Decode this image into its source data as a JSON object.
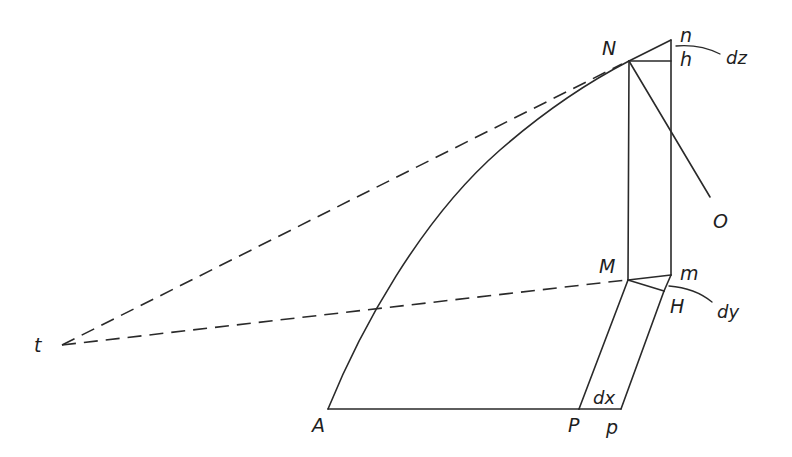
{
  "diagram": {
    "type": "geometric-construction",
    "stroke_color": "#2a2a2a",
    "label_color": "#1e1e1e",
    "points": {
      "t": {
        "label": "t",
        "x": 62,
        "y": 345
      },
      "A": {
        "label": "A",
        "x": 328,
        "y": 409
      },
      "P": {
        "label": "P",
        "x": 579,
        "y": 409
      },
      "p": {
        "label": "p",
        "x": 621,
        "y": 409
      },
      "M": {
        "label": "M",
        "x": 628,
        "y": 280
      },
      "m": {
        "label": "m",
        "x": 671,
        "y": 275
      },
      "H": {
        "label": "H",
        "x": 664,
        "y": 291
      },
      "N": {
        "label": "N",
        "x": 629,
        "y": 61
      },
      "n": {
        "label": "n",
        "x": 671,
        "y": 40
      },
      "h": {
        "label": "h",
        "x": 671,
        "y": 61
      },
      "O": {
        "label": "O",
        "x": 708,
        "y": 204
      }
    },
    "differentials": {
      "dx": "dx",
      "dy": "dy",
      "dz": "dz"
    },
    "elements": [
      {
        "kind": "curve",
        "from": "A",
        "to": "N",
        "style": "solid"
      },
      {
        "kind": "segment",
        "from": "A",
        "to": "P",
        "style": "solid"
      },
      {
        "kind": "segment",
        "from": "P",
        "to": "p",
        "style": "solid"
      },
      {
        "kind": "segment",
        "from": "P",
        "to": "M",
        "style": "solid"
      },
      {
        "kind": "segment",
        "from": "p",
        "to": "H",
        "style": "solid"
      },
      {
        "kind": "segment",
        "from": "H",
        "to": "m",
        "style": "solid"
      },
      {
        "kind": "segment",
        "from": "M",
        "to": "m",
        "style": "solid"
      },
      {
        "kind": "segment",
        "from": "M",
        "to": "H",
        "style": "solid"
      },
      {
        "kind": "segment",
        "from": "M",
        "to": "N",
        "style": "solid"
      },
      {
        "kind": "segment",
        "from": "m",
        "to": "n",
        "style": "solid"
      },
      {
        "kind": "segment",
        "from": "N",
        "to": "h",
        "style": "solid"
      },
      {
        "kind": "segment",
        "from": "N",
        "to": "n",
        "style": "solid"
      },
      {
        "kind": "segment",
        "from": "N",
        "to": "O",
        "style": "solid"
      },
      {
        "kind": "segment",
        "from": "t",
        "to": "N",
        "style": "dashed"
      },
      {
        "kind": "segment",
        "from": "t",
        "to": "M",
        "style": "dashed"
      }
    ]
  }
}
